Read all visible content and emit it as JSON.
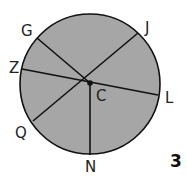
{
  "diagram": {
    "type": "circle-with-radii-and-chords",
    "figure_number": "3",
    "colors": {
      "fill": "#a6a6a6",
      "stroke": "#111111",
      "text": "#222222",
      "background": "#ffffff"
    },
    "circle": {
      "cx": 90,
      "cy": 84,
      "r": 70
    },
    "center": {
      "label": "C",
      "x": 90,
      "y": 83
    },
    "points": [
      {
        "label": "G",
        "x": 37,
        "y": 38
      },
      {
        "label": "J",
        "x": 138,
        "y": 33
      },
      {
        "label": "Z",
        "x": 22,
        "y": 69
      },
      {
        "label": "L",
        "x": 158,
        "y": 95
      },
      {
        "label": "Q",
        "x": 33,
        "y": 121
      },
      {
        "label": "N",
        "x": 90,
        "y": 155
      }
    ],
    "segments": [
      {
        "name": "GC",
        "from": "G",
        "to": "C"
      },
      {
        "name": "JQ",
        "from": "J",
        "to": "Q"
      },
      {
        "name": "ZL",
        "from": "Z",
        "to": "L"
      },
      {
        "name": "CN",
        "from": "C",
        "to": "N"
      }
    ],
    "labels": {
      "G": "G",
      "J": "J",
      "Z": "Z",
      "L": "L",
      "Q": "Q",
      "C": "C",
      "N": "N"
    }
  }
}
